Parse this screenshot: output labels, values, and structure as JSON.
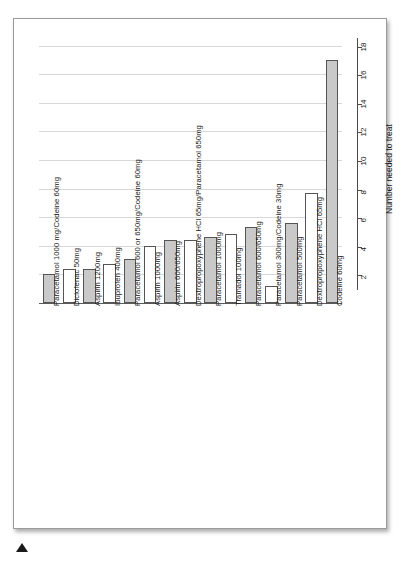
{
  "chart_data": {
    "type": "bar",
    "title": "",
    "xlabel": "",
    "ylabel": "Number needed to treat",
    "ylim": [
      0,
      18.6
    ],
    "grid": true,
    "legend": "none",
    "yticks": [
      2,
      4,
      6,
      8,
      10,
      12,
      14,
      16,
      18
    ],
    "categories": [
      "Paracetamol 1000 mg/Codeine 60mg",
      "Diclofenac 50mg",
      "Aspirin 1200mg",
      "Ibuprofen 400mg",
      "Paracetamol 600 or 650mg/Codeine 60mg",
      "Aspirin 1000mg",
      "Aspirin 600/650mg",
      "Dextropropoxyphene HCl 65mg/Paracetamol 650mg",
      "Paracetamol 1000mg",
      "Tramadol 100mg",
      "Paracetamol 600/650mg",
      "Paracetamol 300mg/Codeine 30mg",
      "Paracetamol 500mg",
      "Dextropropoxyphene HCl 65mg",
      "Codeine 60mg"
    ],
    "values": [
      2.0,
      2.4,
      2.4,
      2.7,
      3.1,
      4.0,
      4.4,
      4.4,
      4.6,
      4.8,
      5.3,
      1.2,
      5.6,
      7.7,
      17.0
    ],
    "fills": [
      "grey",
      "white",
      "grey",
      "white",
      "grey",
      "white",
      "grey",
      "white",
      "grey",
      "white",
      "grey",
      "white",
      "grey",
      "white",
      "grey"
    ]
  },
  "colors": {
    "bar_grey": "#c9c9c9",
    "bar_white": "#ffffff",
    "bar_border": "#555555",
    "gridline": "#d8d8d8",
    "axis": "#4a4a4a",
    "page_border": "#9a9a9a"
  },
  "page": {
    "marker_icon": "triangle-marker"
  }
}
